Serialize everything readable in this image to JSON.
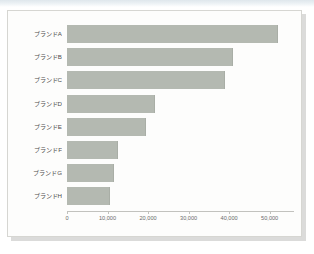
{
  "document": {
    "kind": "scanned-chart-page",
    "background_color": "#ffffff",
    "card_background": "#fdfdfc",
    "card_border_color": "#d6d6d2"
  },
  "chart_data": {
    "type": "bar",
    "orientation": "horizontal",
    "title": "",
    "subtitle": "",
    "xlabel": "",
    "ylabel": "",
    "categories": [
      "ブランドA",
      "ブランドB",
      "ブランドC",
      "ブランドD",
      "ブランドE",
      "ブランドF",
      "ブランドG",
      "ブランドH"
    ],
    "values": [
      52000,
      41000,
      39000,
      21700,
      19500,
      12600,
      11500,
      10700
    ],
    "xlim": [
      0,
      56000
    ],
    "xticks": [
      0,
      10000,
      20000,
      30000,
      40000,
      50000
    ],
    "xtick_labels": [
      "0",
      "10,000",
      "20,000",
      "30,000",
      "40,000",
      "50,000"
    ],
    "grid": false,
    "legend": false,
    "legend_position": "none",
    "bar_color": "#b4b9b1",
    "bar_edge_color": "#a9aea6",
    "axis_color": "#c2c2be",
    "tick_label_color": "#6b6b6b",
    "category_label_color": "#4d4d4d"
  }
}
